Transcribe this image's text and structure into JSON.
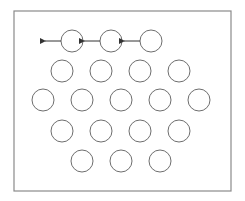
{
  "diagram": {
    "frame": {
      "x": 14,
      "y": 11,
      "width": 217,
      "height": 180,
      "stroke": "#8a8a8a"
    },
    "circle_radius": 11,
    "circle_stroke": "#6e6e6e",
    "arrow_color": "#333333",
    "rows": [
      {
        "y": 41,
        "xs": [
          72,
          111,
          151
        ],
        "arrows": true
      },
      {
        "y": 71,
        "xs": [
          62,
          101,
          140,
          179
        ],
        "arrows": false
      },
      {
        "y": 100,
        "xs": [
          43,
          82,
          121,
          160,
          199
        ],
        "arrows": false
      },
      {
        "y": 131,
        "xs": [
          62,
          101,
          140,
          179
        ],
        "arrows": false
      },
      {
        "y": 161,
        "xs": [
          82,
          121,
          160
        ],
        "arrows": false
      }
    ],
    "arrow_length": 16
  }
}
